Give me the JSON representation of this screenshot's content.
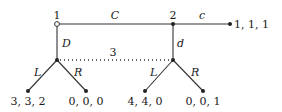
{
  "diagram": {
    "type": "extensive-form game tree",
    "players": {
      "p1": "1",
      "p2": "2",
      "p3": "3"
    },
    "actions": {
      "p1_continue": "C",
      "p1_down": "D",
      "p2_continue": "c",
      "p2_down": "d",
      "p3_left_a": "L",
      "p3_right_a": "R",
      "p3_left_b": "L",
      "p3_right_b": "R"
    },
    "payoffs": {
      "after_Cc": "1, 1, 1",
      "after_D_L": "3, 3, 2",
      "after_D_R": "0, 0, 0",
      "after_Cd_L": "4, 4, 0",
      "after_Cd_R": "0, 0, 1"
    },
    "information_set_label": "3",
    "colors": {
      "line": "#333333",
      "text": "#1a1a1a",
      "background": "#ffffff"
    }
  }
}
